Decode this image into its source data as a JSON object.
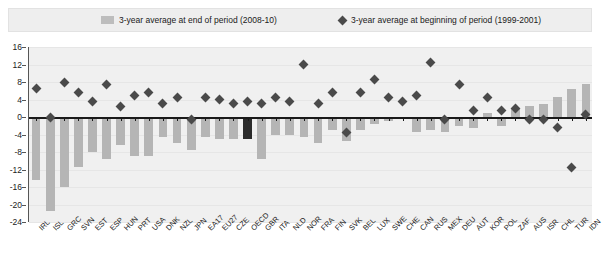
{
  "legend": {
    "bar_label": "3-year average at end of period (2008-10)",
    "marker_label": "3-year average at beginning of period (1999-2001)",
    "bar_color": "#bdbdbd",
    "marker_color": "#4a4a4a"
  },
  "chart_data": {
    "type": "bar",
    "title": "",
    "xlabel": "",
    "ylabel": "",
    "ylim": [
      -24,
      16
    ],
    "yticks": [
      16,
      12,
      8,
      4,
      0,
      -4,
      -8,
      -12,
      -16,
      -20,
      -24
    ],
    "grid": true,
    "legend_position": "top",
    "highlight_category": "OECD",
    "highlight_color": "#2b2b2b",
    "categories": [
      "IRL",
      "ISL",
      "GRC",
      "SVN",
      "EST",
      "ESP",
      "HUN",
      "PRT",
      "USA",
      "DNK",
      "NZL",
      "JPN",
      "EA17",
      "EU27",
      "CZE",
      "OECD",
      "GBR",
      "ITA",
      "NLD",
      "NOR",
      "FRA",
      "FIN",
      "SVK",
      "BEL",
      "LUX",
      "SWE",
      "CHE",
      "CAN",
      "RUS",
      "MEX",
      "DEU",
      "AUT",
      "KOR",
      "POL",
      "ZAF",
      "AUS",
      "ISR",
      "CHL",
      "TUR",
      "IDN"
    ],
    "series": [
      {
        "name": "3-year average at end of period (2008-10)",
        "type": "bar",
        "color": "#b5b5b5",
        "values": [
          -14.5,
          -21.5,
          -16.0,
          -11.5,
          -8.0,
          -9.5,
          -6.5,
          -9.0,
          -9.0,
          -4.5,
          -6.0,
          -7.5,
          -4.5,
          -5.0,
          -5.0,
          -5.0,
          -9.5,
          -4.0,
          -4.0,
          -4.5,
          -6.0,
          -3.0,
          -5.5,
          -3.0,
          -1.5,
          -1.0,
          -0.5,
          -3.5,
          -3.0,
          -3.5,
          -2.0,
          -2.5,
          1.0,
          -2.0,
          2.0,
          2.5,
          3.0,
          4.5,
          6.5,
          7.5
        ]
      },
      {
        "name": "3-year average at beginning of period (1999-2001)",
        "type": "scatter",
        "color": "#4a4a4a",
        "values": [
          6.5,
          0.0,
          8.0,
          5.5,
          3.5,
          7.5,
          2.5,
          5.0,
          5.5,
          3.0,
          4.5,
          -0.5,
          4.5,
          4.0,
          3.0,
          3.5,
          3.0,
          4.5,
          3.5,
          12.0,
          3.0,
          5.5,
          -3.5,
          5.5,
          8.5,
          4.5,
          3.5,
          5.0,
          12.5,
          -0.5,
          7.5,
          1.5,
          4.5,
          1.5,
          2.0,
          -0.5,
          -0.5,
          -2.5,
          -11.5,
          0.5
        ]
      }
    ]
  }
}
